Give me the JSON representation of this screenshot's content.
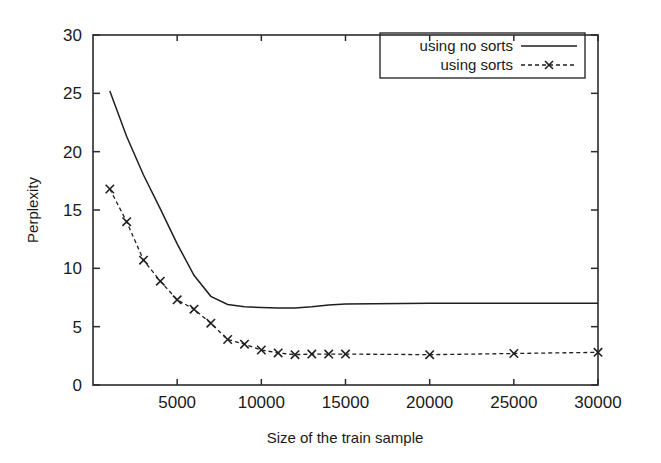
{
  "chart_data": {
    "type": "line",
    "title": "",
    "xlabel": "Size of the train sample",
    "ylabel": "Perplexity",
    "xlim": [
      0,
      30000
    ],
    "ylim": [
      0,
      30
    ],
    "xticks": [
      0,
      5000,
      10000,
      15000,
      20000,
      25000,
      30000
    ],
    "xticklabels": [
      "",
      "5000",
      "10000",
      "15000",
      "20000",
      "25000",
      "30000"
    ],
    "yticks": [
      0,
      5,
      10,
      15,
      20,
      25,
      30
    ],
    "yticklabels": [
      "0",
      "5",
      "10",
      "15",
      "20",
      "25",
      "30"
    ],
    "grid": false,
    "legend_position": "top-right",
    "series": [
      {
        "name": "using no sorts",
        "style": "solid",
        "marker": "none",
        "color": "#1f1f1f",
        "x": [
          1000,
          2000,
          3000,
          4000,
          5000,
          6000,
          7000,
          8000,
          9000,
          10000,
          11000,
          12000,
          13000,
          14000,
          15000,
          20000,
          25000,
          30000
        ],
        "y": [
          25.2,
          21.3,
          18.0,
          15.1,
          12.1,
          9.4,
          7.6,
          6.9,
          6.7,
          6.65,
          6.6,
          6.6,
          6.7,
          6.85,
          6.95,
          7.0,
          7.0,
          7.0
        ]
      },
      {
        "name": "using sorts",
        "style": "dashed",
        "marker": "x",
        "color": "#1f1f1f",
        "x": [
          1000,
          2000,
          3000,
          4000,
          5000,
          6000,
          7000,
          8000,
          9000,
          10000,
          11000,
          12000,
          13000,
          14000,
          15000,
          20000,
          25000,
          30000
        ],
        "y": [
          16.8,
          14.0,
          10.7,
          8.9,
          7.3,
          6.5,
          5.3,
          3.9,
          3.5,
          3.0,
          2.75,
          2.6,
          2.65,
          2.65,
          2.65,
          2.6,
          2.7,
          2.8
        ]
      }
    ],
    "legend": [
      {
        "label": "using no sorts",
        "style": "solid",
        "marker": "none"
      },
      {
        "label": "using sorts",
        "style": "dashed",
        "marker": "x"
      }
    ]
  },
  "colors": {
    "axis": "#2b2b2b",
    "line": "#1f1f1f",
    "background": "#ffffff"
  }
}
